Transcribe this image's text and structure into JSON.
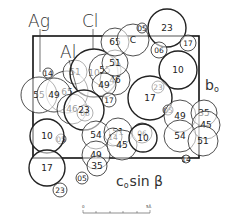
{
  "labels": {
    "ag": "Ag",
    "cl": "Cl",
    "al": "Al",
    "c": "C",
    "b_axis": "b",
    "b_sub": "o",
    "c_axis": "c",
    "c_sub": "o",
    "sin_beta": "sin β"
  },
  "scale_bar": {
    "start": "0",
    "end": "5Å"
  },
  "atoms": [
    {
      "x": 67,
      "y": 92,
      "r": 21,
      "label": "65",
      "heavy": false
    },
    {
      "x": 39,
      "y": 95,
      "r": 18,
      "label": "55",
      "heavy": false
    },
    {
      "x": 54,
      "y": 95,
      "r": 17,
      "label": "49",
      "heavy": false
    },
    {
      "x": 72,
      "y": 109,
      "r": 15,
      "label": "46",
      "heavy": false
    },
    {
      "x": 75,
      "y": 72,
      "r": 12,
      "label": "51",
      "heavy": false
    },
    {
      "x": 48,
      "y": 73,
      "r": 5,
      "label": "14",
      "heavy": false,
      "small": true
    },
    {
      "x": 94,
      "y": 73,
      "r": 24,
      "label": "10",
      "heavy": true
    },
    {
      "x": 105,
      "y": 70,
      "r": 16,
      "label": "55",
      "heavy": false
    },
    {
      "x": 115,
      "y": 80,
      "r": 15,
      "label": "46",
      "heavy": false
    },
    {
      "x": 104,
      "y": 85,
      "r": 12,
      "label": "49",
      "heavy": false
    },
    {
      "x": 115,
      "y": 63,
      "r": 13,
      "label": "51",
      "heavy": false
    },
    {
      "x": 115,
      "y": 42,
      "r": 14,
      "label": "65",
      "heavy": false
    },
    {
      "x": 133,
      "y": 40,
      "r": 16,
      "label": "C",
      "heavy": false,
      "isText": true
    },
    {
      "x": 142,
      "y": 28,
      "r": 5,
      "label": "05",
      "heavy": false,
      "small": true
    },
    {
      "x": 167,
      "y": 28,
      "r": 19,
      "label": "23",
      "heavy": true
    },
    {
      "x": 188,
      "y": 43,
      "r": 8,
      "label": "17",
      "heavy": false,
      "small": true
    },
    {
      "x": 159,
      "y": 50,
      "r": 8,
      "label": "06",
      "heavy": false,
      "small": true
    },
    {
      "x": 178,
      "y": 70,
      "r": 19,
      "label": "10",
      "heavy": true
    },
    {
      "x": 158,
      "y": 87,
      "r": 6,
      "label": "23",
      "heavy": false,
      "small": true
    },
    {
      "x": 150,
      "y": 98,
      "r": 22,
      "label": "17",
      "heavy": true
    },
    {
      "x": 168,
      "y": 110,
      "r": 5,
      "label": "05",
      "heavy": false,
      "small": true
    },
    {
      "x": 85,
      "y": 113,
      "r": 8,
      "label": "06",
      "heavy": false,
      "small": true
    },
    {
      "x": 84,
      "y": 110,
      "r": 20,
      "label": "23",
      "heavy": true
    },
    {
      "x": 109,
      "y": 100,
      "r": 7,
      "label": "17",
      "heavy": false,
      "small": true
    },
    {
      "x": 61,
      "y": 139,
      "r": 5,
      "label": "05",
      "heavy": false,
      "small": true
    },
    {
      "x": 47,
      "y": 136,
      "r": 17,
      "label": "10",
      "heavy": true
    },
    {
      "x": 47,
      "y": 168,
      "r": 18,
      "label": "17",
      "heavy": true
    },
    {
      "x": 60,
      "y": 190,
      "r": 7,
      "label": "23",
      "heavy": false,
      "small": true
    },
    {
      "x": 96,
      "y": 135,
      "r": 14,
      "label": "54",
      "heavy": false
    },
    {
      "x": 118,
      "y": 132,
      "r": 14,
      "label": "51",
      "heavy": false
    },
    {
      "x": 113,
      "y": 137,
      "r": 9,
      "label": "14",
      "heavy": false,
      "small": true
    },
    {
      "x": 96,
      "y": 155,
      "r": 14,
      "label": "49",
      "heavy": false
    },
    {
      "x": 97,
      "y": 166,
      "r": 10,
      "label": "35",
      "heavy": false
    },
    {
      "x": 82,
      "y": 178,
      "r": 6,
      "label": "05",
      "heavy": false,
      "small": true
    },
    {
      "x": 122,
      "y": 145,
      "r": 15,
      "label": "45",
      "heavy": false
    },
    {
      "x": 142,
      "y": 133,
      "r": 10,
      "label": "06",
      "heavy": false,
      "small": true
    },
    {
      "x": 143,
      "y": 138,
      "r": 14,
      "label": "10",
      "heavy": true
    },
    {
      "x": 180,
      "y": 116,
      "r": 16,
      "label": "49",
      "heavy": false
    },
    {
      "x": 204,
      "y": 113,
      "r": 13,
      "label": "35",
      "heavy": false
    },
    {
      "x": 206,
      "y": 125,
      "r": 14,
      "label": "45",
      "heavy": false
    },
    {
      "x": 180,
      "y": 136,
      "r": 16,
      "label": "54",
      "heavy": false
    },
    {
      "x": 203,
      "y": 141,
      "r": 15,
      "label": "51",
      "heavy": false
    },
    {
      "x": 186,
      "y": 159,
      "r": 4,
      "label": "14",
      "heavy": false,
      "small": true
    }
  ]
}
